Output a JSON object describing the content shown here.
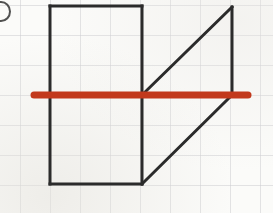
{
  "figure": {
    "canvas": {
      "width": 273,
      "height": 213
    },
    "background_color": "#fbfbf9",
    "grid": {
      "cell_size": 30,
      "line_color": "#c9c9ce",
      "line_width": 1,
      "origin_x": 20,
      "origin_y": 5,
      "visible": true
    },
    "shape": {
      "name": "outlined-shape",
      "stroke_color": "#2b2b2b",
      "stroke_width": 3,
      "fill": "none",
      "rectangle": {
        "name": "left-rectangle",
        "x1": 50,
        "y1": 6,
        "x2": 142,
        "y2": 184,
        "width_cells": 3,
        "height_cells": 6
      },
      "segments": [
        {
          "name": "rect-top-edge",
          "x1": 50,
          "y1": 6,
          "x2": 142,
          "y2": 6
        },
        {
          "name": "rect-left-edge",
          "x1": 50,
          "y1": 6,
          "x2": 50,
          "y2": 184
        },
        {
          "name": "rect-bottom-edge",
          "x1": 50,
          "y1": 184,
          "x2": 142,
          "y2": 184
        },
        {
          "name": "rect-right-edge",
          "x1": 142,
          "y1": 6,
          "x2": 142,
          "y2": 184
        },
        {
          "name": "upper-diagonal",
          "x1": 142,
          "y1": 95,
          "x2": 232,
          "y2": 7
        },
        {
          "name": "right-vertical-edge",
          "x1": 232,
          "y1": 7,
          "x2": 232,
          "y2": 95
        },
        {
          "name": "lower-diagonal",
          "x1": 142,
          "y1": 184,
          "x2": 232,
          "y2": 95
        }
      ]
    },
    "symmetry_line": {
      "name": "line-of-symmetry",
      "color": "#c2391c",
      "stroke_width": 7,
      "orientation": "horizontal",
      "x1": 34,
      "y1": 95,
      "x2": 248,
      "y2": 95,
      "cap": "round"
    },
    "corner_mark": {
      "name": "cut-off-label-circle",
      "visible": true,
      "color": "#2b2b2b"
    }
  },
  "chart_data": {
    "type": "scatter",
    "xlabel": "",
    "ylabel": "",
    "xlim": [
      0,
      273
    ],
    "ylim": [
      213,
      0
    ],
    "grid": true,
    "legend_position": "none",
    "annotations": [
      "Black rectangle spans 3 grid cells wide by 6 grid cells tall",
      "Two diagonals meet the right vertical edge forming a triangle above and below",
      "Red horizontal line at y = 95 is the axis of reflection symmetry"
    ],
    "series": [
      {
        "name": "shape-outline",
        "color": "#2b2b2b",
        "x": [
          50,
          142,
          142,
          232,
          232,
          142,
          142,
          50,
          50
        ],
        "y": [
          6,
          6,
          95,
          7,
          95,
          184,
          184,
          184,
          6
        ]
      },
      {
        "name": "line-of-symmetry",
        "color": "#c2391c",
        "x": [
          34,
          248
        ],
        "y": [
          95,
          95
        ]
      }
    ]
  }
}
